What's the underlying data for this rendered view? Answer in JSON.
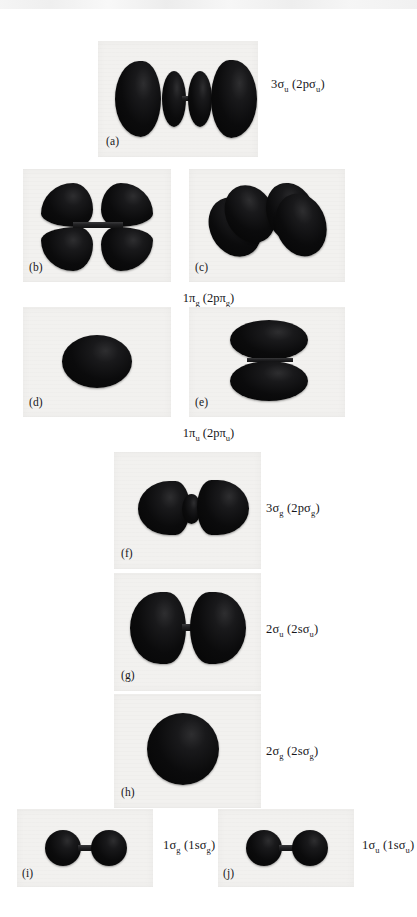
{
  "figure": {
    "background_color": "#ffffff",
    "plate_color": "#f2f1ef",
    "lobe_color": "#0b0b0c"
  },
  "panels": [
    {
      "id": "a",
      "letter": "(a)",
      "label": "3σu (2pσu)",
      "label_html": "3σ<sub>u</sub> (2pσ<sub>u</sub>)",
      "orbital": "3sigma-u",
      "parent": "2p-sigma-u",
      "symmetry": "ungerade",
      "lobes": 4,
      "view": "side"
    },
    {
      "id": "b",
      "letter": "(b)",
      "label": "",
      "label_html": "",
      "orbital": "1pi-g",
      "parent": "2p-pi-g",
      "symmetry": "gerade",
      "lobes": 4,
      "view": "side"
    },
    {
      "id": "c",
      "letter": "(c)",
      "label": "",
      "label_html": "",
      "orbital": "1pi-g",
      "parent": "2p-pi-g",
      "symmetry": "gerade",
      "lobes": 4,
      "view": "oblique"
    },
    {
      "id": "d",
      "letter": "(d)",
      "label": "",
      "label_html": "",
      "orbital": "1pi-u",
      "parent": "2p-pi-u",
      "symmetry": "ungerade",
      "lobes": 1,
      "view": "end-on"
    },
    {
      "id": "e",
      "letter": "(e)",
      "label": "",
      "label_html": "",
      "orbital": "1pi-u",
      "parent": "2p-pi-u",
      "symmetry": "ungerade",
      "lobes": 2,
      "view": "side"
    },
    {
      "id": "f",
      "letter": "(f)",
      "label": "3σg (2pσg)",
      "label_html": "3σ<sub>g</sub> (2pσ<sub>g</sub>)",
      "orbital": "3sigma-g",
      "parent": "2p-sigma-g",
      "symmetry": "gerade",
      "lobes": 3,
      "view": "side"
    },
    {
      "id": "g",
      "letter": "(g)",
      "label": "2σu (2sσu)",
      "label_html": "2σ<sub>u</sub> (2sσ<sub>u</sub>)",
      "orbital": "2sigma-u",
      "parent": "2s-sigma-u",
      "symmetry": "ungerade",
      "lobes": 2,
      "view": "side"
    },
    {
      "id": "h",
      "letter": "(h)",
      "label": "2σg (2sσg)",
      "label_html": "2σ<sub>g</sub> (2sσ<sub>g</sub>)",
      "orbital": "2sigma-g",
      "parent": "2s-sigma-g",
      "symmetry": "gerade",
      "lobes": 1,
      "view": "side"
    },
    {
      "id": "i",
      "letter": "(i)",
      "label": "1σg (1sσg)",
      "label_html": "1σ<sub>g</sub> (1sσ<sub>g</sub>)",
      "orbital": "1sigma-g",
      "parent": "1s-sigma-g",
      "symmetry": "gerade",
      "lobes": 2,
      "view": "side"
    },
    {
      "id": "j",
      "letter": "(j)",
      "label": "1σu (1sσu)",
      "label_html": "1σ<sub>u</sub> (1sσ<sub>u</sub>)",
      "orbital": "1sigma-u",
      "parent": "1s-sigma-u",
      "symmetry": "ungerade",
      "lobes": 2,
      "view": "side"
    }
  ],
  "group_labels": [
    {
      "id": "pi-g-group",
      "label": "1πg (2pπg)",
      "label_html": "1π<sub>g</sub> (2pπ<sub>g</sub>)",
      "applies_to": [
        "b",
        "c"
      ]
    },
    {
      "id": "pi-u-group",
      "label": "1πu (2pπu)",
      "label_html": "1π<sub>u</sub> (2pπ<sub>u</sub>)",
      "applies_to": [
        "d",
        "e"
      ]
    }
  ]
}
